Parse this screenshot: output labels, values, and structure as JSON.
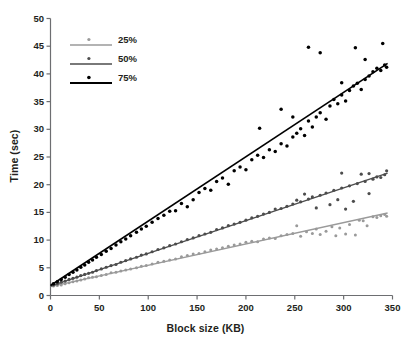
{
  "chart_data": {
    "type": "scatter",
    "title": "",
    "subtitle": "",
    "xlabel": "Block size (KB)",
    "ylabel": "Time (sec)",
    "xlim": [
      0,
      350
    ],
    "ylim": [
      0,
      50
    ],
    "xticks": [
      0,
      50,
      100,
      150,
      200,
      250,
      300,
      350
    ],
    "yticks": [
      0,
      5,
      10,
      15,
      20,
      25,
      30,
      35,
      40,
      45,
      50
    ],
    "grid": false,
    "legend_position": "upper-left-inside",
    "legend": [
      "25%",
      "50%",
      "75%"
    ],
    "annotations": [],
    "series": [
      {
        "name": "25%",
        "color": "#9a9a9a",
        "marker": "dot",
        "trendline": {
          "intercept": 1.6,
          "slope": 0.0386,
          "x_start": 0,
          "x_end": 345,
          "y_start": 1.6,
          "y_end": 14.9
        },
        "points": [
          [
            3,
            1.7
          ],
          [
            7,
            1.8
          ],
          [
            11,
            1.9
          ],
          [
            15,
            2.1
          ],
          [
            19,
            2.3
          ],
          [
            23,
            2.5
          ],
          [
            27,
            2.6
          ],
          [
            31,
            2.8
          ],
          [
            35,
            3.0
          ],
          [
            39,
            3.2
          ],
          [
            43,
            3.3
          ],
          [
            47,
            3.4
          ],
          [
            52,
            3.6
          ],
          [
            57,
            3.8
          ],
          [
            62,
            4.1
          ],
          [
            67,
            4.2
          ],
          [
            72,
            4.4
          ],
          [
            77,
            4.6
          ],
          [
            82,
            4.8
          ],
          [
            88,
            5.0
          ],
          [
            93,
            5.3
          ],
          [
            98,
            5.4
          ],
          [
            104,
            5.7
          ],
          [
            110,
            6.0
          ],
          [
            116,
            6.2
          ],
          [
            122,
            6.4
          ],
          [
            128,
            6.6
          ],
          [
            134,
            7.0
          ],
          [
            140,
            7.2
          ],
          [
            146,
            7.5
          ],
          [
            152,
            7.6
          ],
          [
            158,
            7.9
          ],
          [
            164,
            8.2
          ],
          [
            170,
            8.4
          ],
          [
            176,
            8.6
          ],
          [
            182,
            8.9
          ],
          [
            188,
            9.1
          ],
          [
            194,
            9.3
          ],
          [
            200,
            9.6
          ],
          [
            206,
            9.8
          ],
          [
            212,
            9.7
          ],
          [
            218,
            10.2
          ],
          [
            224,
            10.4
          ],
          [
            230,
            10.3
          ],
          [
            236,
            10.8
          ],
          [
            242,
            11.0
          ],
          [
            248,
            11.2
          ],
          [
            252,
            12.6
          ],
          [
            256,
            10.7
          ],
          [
            262,
            11.5
          ],
          [
            268,
            11.2
          ],
          [
            272,
            12.0
          ],
          [
            276,
            11.0
          ],
          [
            282,
            11.6
          ],
          [
            288,
            12.4
          ],
          [
            292,
            10.8
          ],
          [
            296,
            12.2
          ],
          [
            302,
            11.1
          ],
          [
            306,
            12.8
          ],
          [
            312,
            10.9
          ],
          [
            316,
            13.6
          ],
          [
            320,
            13.5
          ],
          [
            324,
            12.6
          ],
          [
            330,
            14.2
          ],
          [
            334,
            14.1
          ],
          [
            338,
            14.4
          ],
          [
            342,
            14.6
          ],
          [
            344,
            14.3
          ]
        ]
      },
      {
        "name": "50%",
        "color": "#4d4d4d",
        "marker": "dot",
        "trendline": {
          "intercept": 1.7,
          "slope": 0.0591,
          "x_start": 0,
          "x_end": 345,
          "y_start": 1.7,
          "y_end": 22.1
        },
        "points": [
          [
            3,
            1.9
          ],
          [
            7,
            2.1
          ],
          [
            11,
            2.4
          ],
          [
            15,
            2.6
          ],
          [
            19,
            2.9
          ],
          [
            23,
            3.1
          ],
          [
            27,
            3.3
          ],
          [
            31,
            3.6
          ],
          [
            35,
            3.8
          ],
          [
            39,
            4.0
          ],
          [
            43,
            4.2
          ],
          [
            47,
            4.5
          ],
          [
            52,
            4.8
          ],
          [
            57,
            5.1
          ],
          [
            62,
            5.4
          ],
          [
            67,
            5.6
          ],
          [
            72,
            6.0
          ],
          [
            77,
            6.3
          ],
          [
            82,
            6.6
          ],
          [
            88,
            6.9
          ],
          [
            93,
            7.3
          ],
          [
            98,
            7.5
          ],
          [
            104,
            7.9
          ],
          [
            110,
            8.3
          ],
          [
            116,
            8.6
          ],
          [
            122,
            9.0
          ],
          [
            128,
            9.3
          ],
          [
            134,
            9.7
          ],
          [
            140,
            10.1
          ],
          [
            146,
            10.4
          ],
          [
            152,
            10.8
          ],
          [
            158,
            11.1
          ],
          [
            164,
            11.4
          ],
          [
            170,
            11.9
          ],
          [
            176,
            12.2
          ],
          [
            182,
            12.6
          ],
          [
            188,
            12.9
          ],
          [
            194,
            13.2
          ],
          [
            200,
            13.6
          ],
          [
            206,
            14.0
          ],
          [
            212,
            14.3
          ],
          [
            218,
            14.7
          ],
          [
            224,
            15.0
          ],
          [
            230,
            15.6
          ],
          [
            236,
            15.7
          ],
          [
            242,
            16.1
          ],
          [
            248,
            16.5
          ],
          [
            252,
            17.2
          ],
          [
            256,
            16.9
          ],
          [
            260,
            18.3
          ],
          [
            264,
            17.4
          ],
          [
            268,
            17.8
          ],
          [
            272,
            15.8
          ],
          [
            276,
            18.1
          ],
          [
            282,
            18.5
          ],
          [
            286,
            16.4
          ],
          [
            290,
            19.0
          ],
          [
            294,
            17.3
          ],
          [
            298,
            19.4
          ],
          [
            302,
            15.6
          ],
          [
            306,
            19.8
          ],
          [
            310,
            17.0
          ],
          [
            314,
            20.2
          ],
          [
            318,
            21.9
          ],
          [
            322,
            20.6
          ],
          [
            326,
            18.4
          ],
          [
            330,
            21.0
          ],
          [
            334,
            21.4
          ],
          [
            338,
            21.3
          ],
          [
            342,
            21.8
          ],
          [
            344,
            22.5
          ],
          [
            298,
            22.1
          ],
          [
            326,
            22.0
          ]
        ]
      },
      {
        "name": "75%",
        "color": "#000000",
        "marker": "dot",
        "trendline": {
          "intercept": 1.8,
          "slope": 0.1165,
          "x_start": 0,
          "x_end": 345,
          "y_start": 1.8,
          "y_end": 41.9
        },
        "points": [
          [
            3,
            2.1
          ],
          [
            7,
            2.5
          ],
          [
            11,
            2.9
          ],
          [
            15,
            3.3
          ],
          [
            19,
            3.8
          ],
          [
            23,
            4.2
          ],
          [
            27,
            4.6
          ],
          [
            31,
            5.1
          ],
          [
            35,
            5.5
          ],
          [
            39,
            6.0
          ],
          [
            43,
            6.4
          ],
          [
            47,
            6.9
          ],
          [
            52,
            7.4
          ],
          [
            57,
            8.0
          ],
          [
            62,
            8.5
          ],
          [
            67,
            9.1
          ],
          [
            72,
            9.7
          ],
          [
            77,
            10.2
          ],
          [
            82,
            10.8
          ],
          [
            88,
            11.4
          ],
          [
            93,
            12.0
          ],
          [
            98,
            12.5
          ],
          [
            104,
            13.2
          ],
          [
            110,
            13.9
          ],
          [
            116,
            14.5
          ],
          [
            122,
            15.2
          ],
          [
            128,
            15.3
          ],
          [
            134,
            16.6
          ],
          [
            140,
            16.0
          ],
          [
            146,
            17.3
          ],
          [
            152,
            18.6
          ],
          [
            158,
            19.3
          ],
          [
            164,
            19.0
          ],
          [
            170,
            20.6
          ],
          [
            176,
            21.2
          ],
          [
            182,
            20.1
          ],
          [
            188,
            22.5
          ],
          [
            194,
            23.2
          ],
          [
            200,
            22.7
          ],
          [
            206,
            24.5
          ],
          [
            212,
            25.3
          ],
          [
            218,
            24.9
          ],
          [
            224,
            26.3
          ],
          [
            230,
            26.0
          ],
          [
            236,
            27.4
          ],
          [
            242,
            27.0
          ],
          [
            248,
            28.6
          ],
          [
            252,
            29.3
          ],
          [
            256,
            30.1
          ],
          [
            260,
            28.9
          ],
          [
            264,
            31.5
          ],
          [
            268,
            30.4
          ],
          [
            272,
            32.2
          ],
          [
            276,
            33.0
          ],
          [
            282,
            31.8
          ],
          [
            286,
            34.2
          ],
          [
            290,
            35.4
          ],
          [
            294,
            34.6
          ],
          [
            298,
            36.2
          ],
          [
            302,
            35.1
          ],
          [
            306,
            37.0
          ],
          [
            310,
            37.8
          ],
          [
            314,
            38.3
          ],
          [
            318,
            37.2
          ],
          [
            322,
            39.0
          ],
          [
            326,
            39.6
          ],
          [
            330,
            40.4
          ],
          [
            334,
            41.0
          ],
          [
            338,
            40.6
          ],
          [
            342,
            41.6
          ],
          [
            344,
            41.2
          ],
          [
            264,
            44.8
          ],
          [
            276,
            43.8
          ],
          [
            312,
            44.7
          ],
          [
            340,
            45.5
          ],
          [
            322,
            42.6
          ],
          [
            298,
            38.4
          ],
          [
            236,
            33.6
          ],
          [
            248,
            32.2
          ],
          [
            214,
            30.2
          ]
        ]
      }
    ]
  },
  "legend_items": [
    {
      "label": "25%",
      "color": "#9a9a9a"
    },
    {
      "label": "50%",
      "color": "#4d4d4d"
    },
    {
      "label": "75%",
      "color": "#000000"
    }
  ],
  "axis": {
    "color": "#6d6e71",
    "text_color": "#231f20"
  }
}
